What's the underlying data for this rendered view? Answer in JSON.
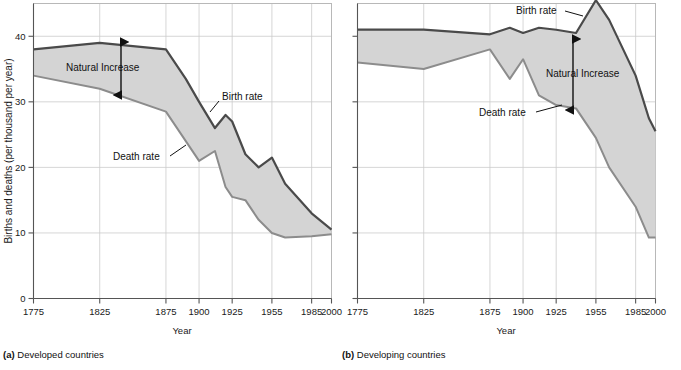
{
  "figure": {
    "y_axis_label": "Births and deaths (per thousand per year)",
    "x_axis_label": "Year",
    "y_ticks": [
      0,
      10,
      20,
      30,
      40
    ],
    "y_range": [
      0,
      45
    ],
    "x_ticks": [
      1775,
      1825,
      1875,
      1900,
      1925,
      1955,
      1985,
      2000
    ],
    "x_range": [
      1775,
      2000
    ],
    "colors": {
      "birth_line": "#4a4a4a",
      "death_line": "#8c8c8c",
      "fill": "#d4d4d4",
      "grid": "#cccccc",
      "axis": "#555555",
      "text": "#111111"
    },
    "annotations": {
      "natural_increase": "Natural Increase",
      "birth_rate": "Birth rate",
      "death_rate": "Death rate"
    }
  },
  "panels": [
    {
      "id": "developed",
      "caption_label": "(a)",
      "caption_text": "Developed countries",
      "chart_data": {
        "type": "area",
        "title": "(a) Developed countries",
        "xlabel": "Year",
        "ylabel": "Births and deaths (per thousand per year)",
        "xlim": [
          1775,
          2000
        ],
        "ylim": [
          0,
          45
        ],
        "grid": true,
        "legend": "inline-annotations",
        "x": [
          1775,
          1825,
          1875,
          1890,
          1900,
          1912,
          1920,
          1925,
          1935,
          1945,
          1955,
          1965,
          1985,
          2000
        ],
        "series": [
          {
            "name": "Birth rate",
            "values": [
              38.0,
              39.0,
              38.0,
              33.5,
              30.0,
              26.0,
              28.0,
              27.0,
              22.0,
              20.0,
              21.5,
              17.5,
              13.0,
              10.5
            ]
          },
          {
            "name": "Death rate",
            "values": [
              34.0,
              32.0,
              28.5,
              24.0,
              21.0,
              22.5,
              17.0,
              15.5,
              15.0,
              12.0,
              10.0,
              9.3,
              9.5,
              9.8
            ]
          }
        ],
        "shaded_between": [
          "Birth rate",
          "Death rate"
        ],
        "annotations": [
          {
            "text": "Natural Increase",
            "x": 1838,
            "y": 35.2
          },
          {
            "text": "Birth rate",
            "x": 1930,
            "y": 30.0
          },
          {
            "text": "Death rate",
            "x": 1862,
            "y": 21.8
          }
        ]
      }
    },
    {
      "id": "developing",
      "caption_label": "(b)",
      "caption_text": "Developing countries",
      "chart_data": {
        "type": "area",
        "title": "(b) Developing countries",
        "xlabel": "Year",
        "ylabel": "Births and deaths (per thousand per year)",
        "xlim": [
          1775,
          2000
        ],
        "ylim": [
          0,
          45
        ],
        "grid": true,
        "legend": "inline-annotations",
        "x": [
          1775,
          1825,
          1875,
          1890,
          1900,
          1912,
          1925,
          1940,
          1955,
          1965,
          1985,
          1995,
          2000
        ],
        "series": [
          {
            "name": "Birth rate",
            "values": [
              41.0,
              41.0,
              40.3,
              41.3,
              40.5,
              41.3,
              41.0,
              40.5,
              45.5,
              42.5,
              34.0,
              27.5,
              25.5
            ]
          },
          {
            "name": "Death rate",
            "values": [
              36.0,
              35.0,
              38.0,
              33.5,
              36.5,
              31.0,
              29.5,
              29.0,
              24.5,
              20.0,
              14.0,
              9.3,
              9.3
            ]
          }
        ],
        "shaded_between": [
          "Birth rate",
          "Death rate"
        ],
        "annotations": [
          {
            "text": "Birth rate",
            "x": 1934,
            "y": 44.2
          },
          {
            "text": "Natural Increase",
            "x": 1948,
            "y": 35.0
          },
          {
            "text": "Death rate",
            "x": 1906,
            "y": 27.0
          }
        ]
      }
    }
  ]
}
